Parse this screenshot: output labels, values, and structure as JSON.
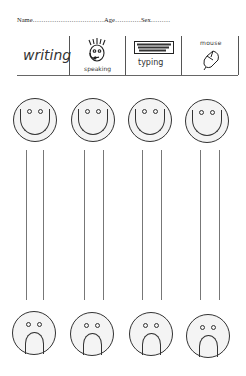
{
  "header": {
    "name_label": "Name",
    "name_dots": "……………………………",
    "age_label": "Age",
    "age_dots": "…………",
    "sex_label": "Sex",
    "sex_dots": "………"
  },
  "activities": [
    {
      "label": "writing",
      "icon": "writing-word"
    },
    {
      "label": "speaking",
      "icon": "face-with-headset-icon"
    },
    {
      "label": "typing",
      "icon": "keyboard-icon"
    },
    {
      "label": "mouse",
      "icon": "computer-mouse-icon"
    }
  ],
  "scales": [
    {
      "top": "happy-face",
      "bottom": "sad-face"
    },
    {
      "top": "happy-face",
      "bottom": "sad-face"
    },
    {
      "top": "happy-face",
      "bottom": "sad-face"
    },
    {
      "top": "happy-face",
      "bottom": "sad-face"
    }
  ]
}
